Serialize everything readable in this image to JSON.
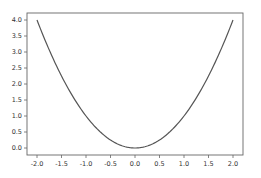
{
  "chart_data": {
    "type": "line",
    "title": "",
    "xlabel": "",
    "ylabel": "",
    "xlim": [
      -2.2,
      2.2
    ],
    "ylim": [
      -0.2,
      4.2
    ],
    "grid": false,
    "legend": null,
    "x_ticks": [
      "-2.0",
      "-1.5",
      "-1.0",
      "-0.5",
      "0.0",
      "0.5",
      "1.0",
      "1.5",
      "2.0"
    ],
    "x_tick_values": [
      -2.0,
      -1.5,
      -1.0,
      -0.5,
      0.0,
      0.5,
      1.0,
      1.5,
      2.0
    ],
    "y_ticks": [
      "0.0",
      "0.5",
      "1.0",
      "1.5",
      "2.0",
      "2.5",
      "3.0",
      "3.5",
      "4.0"
    ],
    "y_tick_values": [
      0.0,
      0.5,
      1.0,
      1.5,
      2.0,
      2.5,
      3.0,
      3.5,
      4.0
    ],
    "series": [
      {
        "name": "y = x^2",
        "color": "#555555",
        "x": [
          -2.0,
          -1.75,
          -1.5,
          -1.25,
          -1.0,
          -0.75,
          -0.5,
          -0.25,
          0.0,
          0.25,
          0.5,
          0.75,
          1.0,
          1.25,
          1.5,
          1.75,
          2.0
        ],
        "values": [
          4.0,
          3.0625,
          2.25,
          1.5625,
          1.0,
          0.5625,
          0.25,
          0.0625,
          0.0,
          0.0625,
          0.25,
          0.5625,
          1.0,
          1.5625,
          2.25,
          3.0625,
          4.0
        ]
      }
    ]
  },
  "colors": {
    "line": "#555555",
    "axes": "#555555",
    "background": "#ffffff"
  }
}
